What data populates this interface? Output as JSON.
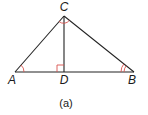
{
  "figure": {
    "caption": "(a)",
    "vertices": [
      {
        "id": "A",
        "label": "A"
      },
      {
        "id": "B",
        "label": "B"
      },
      {
        "id": "C",
        "label": "C"
      },
      {
        "id": "D",
        "label": "D"
      }
    ],
    "segments": [
      "AC",
      "CB",
      "AB",
      "CD"
    ],
    "angle_marks": [
      {
        "vertex": "A",
        "type": "single-arc"
      },
      {
        "vertex": "B",
        "type": "double-arc"
      },
      {
        "vertex": "C",
        "type": "arc"
      },
      {
        "vertex": "D",
        "type": "right-angle"
      }
    ],
    "mark_color": "#d9534f"
  }
}
